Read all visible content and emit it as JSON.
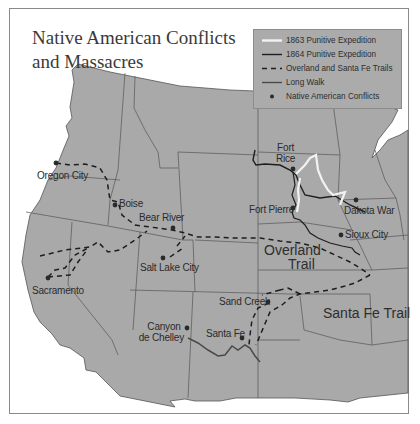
{
  "map": {
    "title_line1": "Native American Conflicts",
    "title_line2": "and Massacres",
    "colors": {
      "land": "#a9a9a9",
      "border": "#555555",
      "background": "#ffffff",
      "legend_bg": "#ababab",
      "punitive_1863": "#f2f2f2",
      "punitive_1864": "#1e1e1e",
      "trails": "#1e1e1e",
      "long_walk": "#4a4a4a",
      "conflict_marker": "#2a2a2a"
    }
  },
  "legend": {
    "items": [
      {
        "symbol": "white-solid-line",
        "label": "1863 Punitive Expedition"
      },
      {
        "symbol": "black-solid-line",
        "label": "1864 Punitive Expedition"
      },
      {
        "symbol": "dashed-line",
        "label": "Overland and Santa Fe Trails"
      },
      {
        "symbol": "gray-solid-line",
        "label": "Long Walk"
      },
      {
        "symbol": "dot-marker",
        "label": "Native American Conflicts"
      }
    ]
  },
  "places": {
    "fort_rice": {
      "line1": "Fort",
      "line2": "Rice"
    },
    "fort_pierre": "Fort Pierre",
    "dakota_war": "Dakota War",
    "sioux_city": "Sioux City",
    "oregon_city": "Oregon City",
    "boise": "Boise",
    "bear_river": "Bear River",
    "salt_lake_city": "Salt Lake City",
    "sacramento": "Sacramento",
    "sand_creek": "Sand Creek",
    "santa_fe": "Santa Fe",
    "canyon_de_chelley": {
      "line1": "Canyon",
      "line2": "de Chelley"
    }
  },
  "trails": {
    "overland": {
      "line1": "Overland",
      "line2": "Trail"
    },
    "santa_fe": "Santa Fe Trail"
  }
}
